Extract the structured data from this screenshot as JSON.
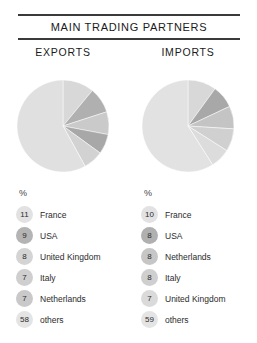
{
  "header": {
    "title": "MAIN TRADING PARTNERS"
  },
  "columns": {
    "exports_label": "EXPORTS",
    "imports_label": "IMPORTS"
  },
  "legend_unit": "%",
  "chart_data": [
    {
      "type": "pie",
      "title": "EXPORTS",
      "unit": "%",
      "labels": [
        "France",
        "USA",
        "United Kingdom",
        "Italy",
        "Netherlands",
        "others"
      ],
      "values": [
        11,
        9,
        8,
        7,
        7,
        58
      ],
      "colors": [
        "#d8d8d8",
        "#b0b0b0",
        "#cacaca",
        "#a8a8a8",
        "#d2d2d2",
        "#e0e0e0"
      ],
      "start_angle": 0,
      "direction": "clockwise",
      "legend_position": "below"
    },
    {
      "type": "pie",
      "title": "IMPORTS",
      "unit": "%",
      "labels": [
        "France",
        "USA",
        "Netherlands",
        "Italy",
        "United Kingdom",
        "others"
      ],
      "values": [
        10,
        8,
        8,
        8,
        7,
        59
      ],
      "colors": [
        "#d8d8d8",
        "#a8a8a8",
        "#c4c4c4",
        "#d0d0d0",
        "#dcdcdc",
        "#e2e2e2"
      ],
      "start_angle": 0,
      "direction": "clockwise",
      "legend_position": "below"
    }
  ],
  "exports_legend": [
    {
      "value": "11",
      "label": "France",
      "badge_color": "#e2e2e2"
    },
    {
      "value": "9",
      "label": "USA",
      "badge_color": "#b4b4b4"
    },
    {
      "value": "8",
      "label": "United Kingdom",
      "badge_color": "#d4d4d4"
    },
    {
      "value": "7",
      "label": "Italy",
      "badge_color": "#cfcfcf"
    },
    {
      "value": "7",
      "label": "Netherlands",
      "badge_color": "#c9c9c9"
    },
    {
      "value": "58",
      "label": "others",
      "badge_color": "#e4e4e4"
    }
  ],
  "imports_legend": [
    {
      "value": "10",
      "label": "France",
      "badge_color": "#e2e2e2"
    },
    {
      "value": "8",
      "label": "USA",
      "badge_color": "#b0b0b0"
    },
    {
      "value": "8",
      "label": "Netherlands",
      "badge_color": "#c6c6c6"
    },
    {
      "value": "8",
      "label": "Italy",
      "badge_color": "#cfcfcf"
    },
    {
      "value": "7",
      "label": "United Kingdom",
      "badge_color": "#dadada"
    },
    {
      "value": "59",
      "label": "others",
      "badge_color": "#e4e4e4"
    }
  ]
}
